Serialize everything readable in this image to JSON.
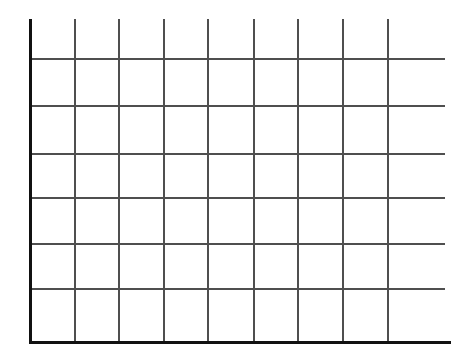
{
  "figure": {
    "title": "",
    "subtitle": "",
    "background_color": "#ffffff",
    "width": 464,
    "height": 354
  },
  "axes": {
    "y_axis": {
      "name": "y-axis",
      "label": "",
      "color": "#111111",
      "thickness": 3,
      "x": 30,
      "y_top": 19,
      "y_bottom": 344,
      "tick_labels": []
    },
    "x_axis": {
      "name": "x-axis",
      "label": "",
      "color": "#111111",
      "thickness": 3,
      "y": 341,
      "x_left": 29,
      "x_right": 451,
      "tick_labels": []
    }
  },
  "grid": {
    "visible": true,
    "color": "#4f4f4f",
    "thickness": 1.6,
    "plot_left": 31,
    "plot_right": 445,
    "plot_top": 19,
    "plot_bottom": 341,
    "vertical_lines_x": [
      74,
      118,
      163,
      207,
      253,
      297,
      342,
      387
    ],
    "horizontal_lines_y": [
      58,
      105,
      153,
      197,
      243,
      288
    ],
    "columns": 9,
    "rows": 7
  },
  "chart_data": {
    "type": "line",
    "title": "",
    "subtitle": "",
    "xlabel": "",
    "ylabel": "",
    "categories": [],
    "x": [],
    "values": [],
    "series": [],
    "annotations": [],
    "legend": {
      "visible": false,
      "position": "none",
      "entries": []
    },
    "grid": true,
    "xlim": [
      0,
      9
    ],
    "ylim": [
      0,
      7
    ],
    "xticks": [],
    "yticks": [],
    "xticklabels": [],
    "yticklabels": [],
    "note": "Empty plot frame: only the grid and the two thick axis spines are drawn. No data series, ticks, labels, title or legend are rendered in the image."
  }
}
